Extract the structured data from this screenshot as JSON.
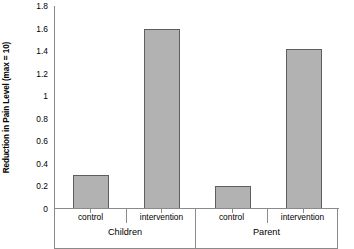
{
  "chart_data": {
    "type": "bar",
    "title": "",
    "xlabel": "",
    "ylabel": "Reduction in Pain Level (max = 10)",
    "ylim": [
      0,
      1.8
    ],
    "grid": false,
    "legend": "none",
    "ytick_labels": [
      "1.8",
      "1.6",
      "1.4",
      "1.2",
      "1",
      "0.8",
      "0.6",
      "0.4",
      "0.2",
      "0"
    ],
    "ytick_values": [
      1.8,
      1.6,
      1.4,
      1.2,
      1.0,
      0.8,
      0.6,
      0.4,
      0.2,
      0
    ],
    "groups": [
      {
        "name": "Children",
        "categories": [
          "control",
          "intervention"
        ],
        "values": [
          0.3,
          1.6
        ]
      },
      {
        "name": "Parent",
        "categories": [
          "control",
          "intervention"
        ],
        "values": [
          0.2,
          1.42
        ]
      }
    ],
    "categories": [
      "control",
      "intervention",
      "control",
      "intervention"
    ],
    "values": [
      0.3,
      1.6,
      0.2,
      1.42
    ],
    "bar_color": "#b2b2b2",
    "bar_edge_color": "#5e5e5e",
    "axis_color": "#8a8a8a"
  }
}
